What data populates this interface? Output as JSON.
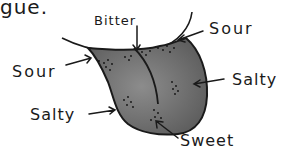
{
  "heading_fragment": "gue.",
  "labels": {
    "bitter": "Bitter",
    "sour_right": "Sour",
    "sour_left": "Sour",
    "salty_right": "Salty",
    "salty_left": "Salty",
    "sweet": "Sweet"
  },
  "colors": {
    "ink": "#1a1a1a",
    "tongue_fill": "#6e6e6e",
    "tongue_highlight": "#8a8a8a",
    "background": "#ffffff"
  }
}
